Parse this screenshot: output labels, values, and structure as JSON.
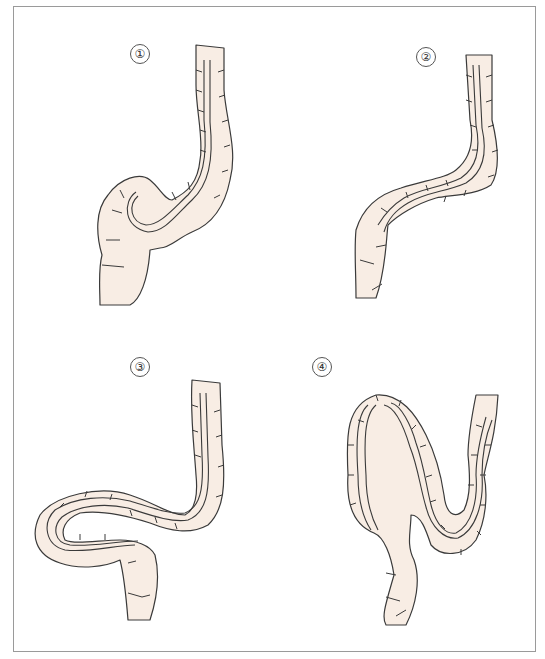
{
  "figure": {
    "panels": [
      {
        "id": 1,
        "label": "①",
        "scope_stage": "Scope formed α-loop in sigmoid colon"
      },
      {
        "id": 2,
        "label": "②",
        "scope_stage": "Scope straightened, sigmoid shortened"
      },
      {
        "id": 3,
        "label": "③",
        "scope_stage": "Scope forming N-loop across sigmoid"
      },
      {
        "id": 4,
        "label": "④",
        "scope_stage": "Scope forming large loop with deep bend"
      }
    ]
  },
  "colors": {
    "border": "#9a9a9a",
    "fill": "#f8ede4",
    "outline": "#3a3a3a",
    "background": "#ffffff"
  }
}
